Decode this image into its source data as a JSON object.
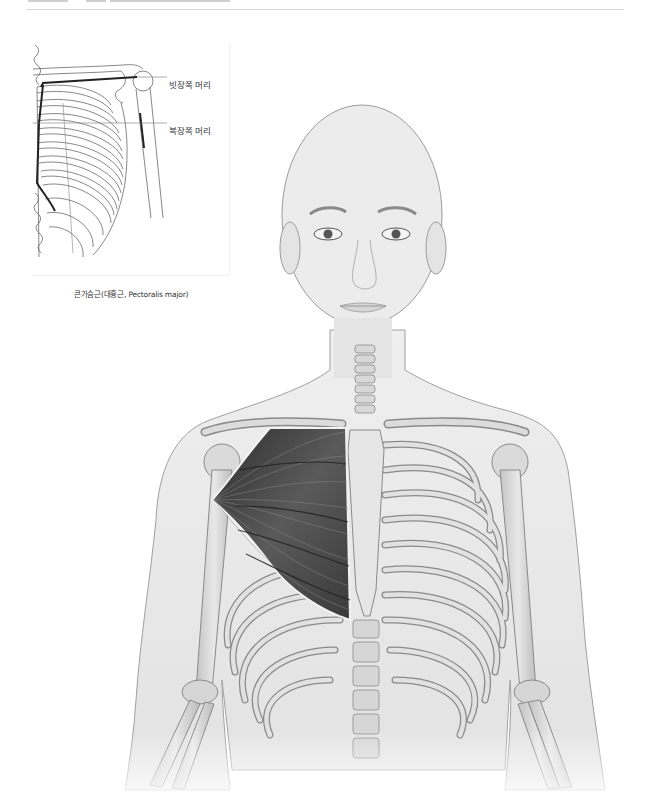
{
  "page": {
    "header_rule": true
  },
  "inset": {
    "labels": [
      {
        "text": "빗장쪽 머리",
        "meaning": "clavicular head"
      },
      {
        "text": "복장쪽 머리",
        "meaning": "sternal head"
      }
    ],
    "caption": "큰가슴근(대흉근, Pectoralis major)"
  },
  "main_figure": {
    "subject": "anterior view of upper body skeleton with right pectoralis major muscle",
    "colors": {
      "skin": "#e6e6e6",
      "skin_outline": "#9a9a9a",
      "bone": "#d2d2d2",
      "bone_outline": "#8a8a8a",
      "muscle_dark": "#3a3a3a",
      "muscle_light": "#8c8c8c",
      "inset_line": "#555555",
      "inset_highlight": "#222222"
    }
  }
}
